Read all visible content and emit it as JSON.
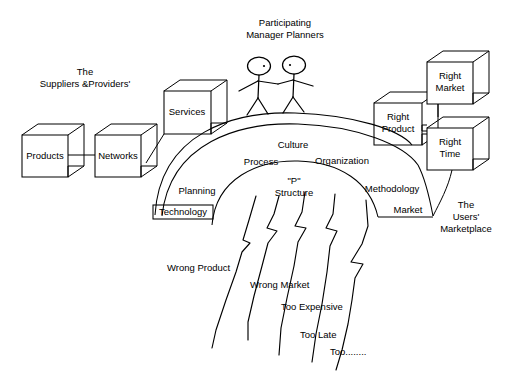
{
  "diagram": {
    "title_supply_side": {
      "line1": "The",
      "line2": "Suppliers &Providers'"
    },
    "title_people": {
      "line1": "Participating",
      "line2": "Manager Planners"
    },
    "title_demand_side": {
      "line1": "The",
      "line2": "Users'",
      "line3": "Marketplace"
    },
    "supply_cubes": [
      {
        "id": "products",
        "label": "Products"
      },
      {
        "id": "networks",
        "label": "Networks"
      },
      {
        "id": "services",
        "label": "Services"
      }
    ],
    "demand_cubes": [
      {
        "id": "right-product",
        "label_line1": "Right",
        "label_line2": "Product"
      },
      {
        "id": "right-market",
        "label_line1": "Right",
        "label_line2": "Market"
      },
      {
        "id": "right-time",
        "label_line1": "Right",
        "label_line2": "Time"
      }
    ],
    "arch_labels": [
      {
        "id": "culture",
        "text": "Culture"
      },
      {
        "id": "process",
        "text": "Process"
      },
      {
        "id": "organization",
        "text": "Organization"
      },
      {
        "id": "p-quote",
        "text": "\"P\""
      },
      {
        "id": "structure",
        "text": "Structure"
      },
      {
        "id": "planning",
        "text": "Planning"
      },
      {
        "id": "technology",
        "text": "Technology"
      },
      {
        "id": "methodology",
        "text": "Methodology"
      },
      {
        "id": "market",
        "text": "Market"
      }
    ],
    "failure_labels": [
      {
        "id": "wrong-product",
        "text": "Wrong Product"
      },
      {
        "id": "wrong-market",
        "text": "Wrong Market"
      },
      {
        "id": "too-expensive",
        "text": "Too Expensive"
      },
      {
        "id": "too-late",
        "text": "Too Late"
      },
      {
        "id": "too-etc",
        "text": "Too........"
      }
    ],
    "colors": {
      "stroke": "#000000",
      "background": "#ffffff",
      "text": "#000000"
    }
  }
}
